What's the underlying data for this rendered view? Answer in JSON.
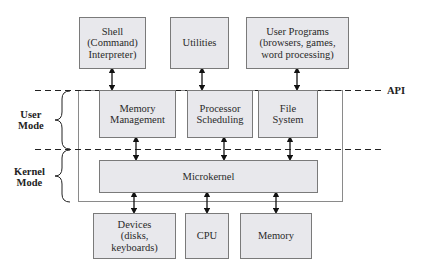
{
  "diagram": {
    "top_boxes": [
      {
        "id": "shell",
        "label": "Shell\n(Command)\nInterpreter)"
      },
      {
        "id": "utilities",
        "label": "Utilities"
      },
      {
        "id": "user-programs",
        "label": "User Programs\n(browsers, games,\nword processing)"
      }
    ],
    "api_label": "API",
    "user_mode_label": "User\nMode",
    "kernel_mode_label": "Kernel\nMode",
    "user_mode_boxes": [
      {
        "id": "memory-management",
        "label": "Memory\nManagement"
      },
      {
        "id": "processor-scheduling",
        "label": "Processor\nScheduling"
      },
      {
        "id": "file-system",
        "label": "File\nSystem"
      }
    ],
    "microkernel_label": "Microkernel",
    "hardware_boxes": [
      {
        "id": "devices",
        "label": "Devices\n(disks,\nkeyboards)"
      },
      {
        "id": "cpu",
        "label": "CPU"
      },
      {
        "id": "memory",
        "label": "Memory"
      }
    ],
    "colors": {
      "box_fill": "#e8e8ec",
      "box_border": "#7a7a7a",
      "line": "#222222"
    }
  }
}
